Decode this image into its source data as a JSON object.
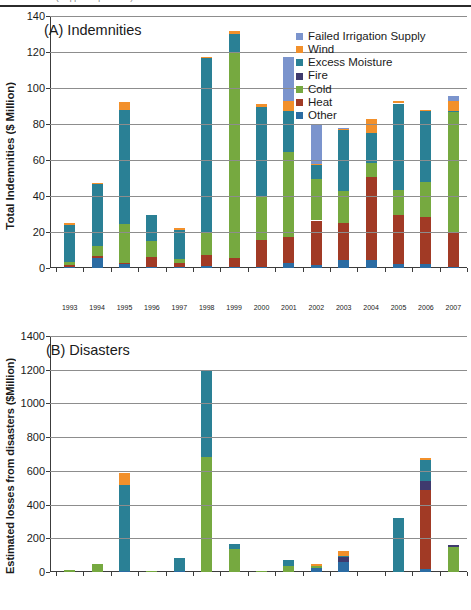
{
  "figure": {
    "top_rule_ghost_text": "(cropped caption line)"
  },
  "chart_data": [
    {
      "id": "panel_a",
      "type": "bar",
      "stacked": true,
      "title": "(A) Indemnities",
      "xlabel": "",
      "ylabel": "Total Indemnities ($ Million)",
      "ylim": [
        0,
        140
      ],
      "yticks": [
        0,
        20,
        40,
        60,
        80,
        100,
        120,
        140
      ],
      "grid": true,
      "legend_position": "top-right",
      "categories": [
        "1993",
        "1994",
        "1995",
        "1996",
        "1997",
        "1998",
        "1999",
        "2000",
        "2001",
        "2002",
        "2003",
        "2004",
        "2005",
        "2006",
        "2007"
      ],
      "series": [
        {
          "name": "Other",
          "color": "#2b6ca3",
          "values": [
            0.6,
            5.3,
            2.0,
            0.5,
            0.5,
            1.2,
            0.5,
            0.8,
            3.0,
            1.8,
            4.2,
            4.6,
            2.2,
            2.0,
            0.4
          ]
        },
        {
          "name": "Heat",
          "color": "#a13a25",
          "values": [
            1.2,
            1.5,
            1.0,
            5.7,
            2.3,
            6.2,
            5.2,
            14.7,
            14.0,
            24.6,
            20.6,
            46.2,
            27.2,
            26.6,
            19.6
          ]
        },
        {
          "name": "Cold",
          "color": "#76a940",
          "values": [
            1.8,
            5.4,
            21.5,
            8.9,
            2.4,
            12.8,
            114.5,
            24.0,
            47.2,
            23.0,
            18.0,
            7.8,
            14.2,
            19.2,
            66.8
          ]
        },
        {
          "name": "Fire",
          "color": "#3f3a6e",
          "values": [
            0.0,
            0.0,
            0.0,
            0.0,
            0.0,
            0.0,
            0.0,
            0.0,
            0.0,
            0.0,
            0.0,
            0.0,
            0.0,
            0.0,
            0.0
          ]
        },
        {
          "name": "Excess Moisture",
          "color": "#2a8095",
          "values": [
            20.4,
            34.8,
            63.5,
            14.4,
            15.8,
            96.8,
            9.8,
            49.8,
            22.8,
            7.8,
            33.8,
            16.4,
            47.8,
            39.4,
            0.6
          ]
        },
        {
          "name": "Wind",
          "color": "#f2902b",
          "values": [
            0.8,
            0.4,
            4.2,
            0.0,
            1.2,
            0.4,
            1.8,
            1.8,
            5.8,
            0.8,
            0.8,
            7.8,
            1.2,
            0.2,
            5.2
          ]
        },
        {
          "name": "Failed Irrigation Supply",
          "color": "#7b94cd",
          "values": [
            0.0,
            0.0,
            0.0,
            0.0,
            0.0,
            0.0,
            0.0,
            0.0,
            24.6,
            21.2,
            0.6,
            0.0,
            0.0,
            0.0,
            3.2
          ]
        }
      ],
      "totals": [
        24.8,
        47.4,
        92.2,
        29.5,
        22.2,
        117.4,
        131.8,
        91.1,
        117.4,
        79.2,
        78.0,
        82.8,
        92.6,
        87.4,
        95.8
      ]
    },
    {
      "id": "panel_b",
      "type": "bar",
      "stacked": true,
      "title": "(B) Disasters",
      "xlabel": "",
      "ylabel": "Estimated losses from disasters ($Million)",
      "ylim": [
        0,
        1400
      ],
      "yticks": [
        0,
        200,
        400,
        600,
        800,
        1000,
        1200,
        1400
      ],
      "grid": true,
      "legend_position": "top-right",
      "categories": [
        "1993",
        "1994",
        "1995",
        "1996",
        "1997",
        "1998",
        "1999",
        "2000",
        "2001",
        "2002",
        "2003",
        "2004",
        "2005",
        "2006",
        "2007"
      ],
      "series": [
        {
          "name": "Other",
          "color": "#2b6ca3",
          "values": [
            0,
            0,
            6,
            0,
            8,
            0,
            0,
            0,
            0,
            22,
            62,
            0,
            0,
            16,
            0
          ]
        },
        {
          "name": "Heat",
          "color": "#a13a25",
          "values": [
            0,
            0,
            0,
            0,
            0,
            0,
            0,
            0,
            0,
            0,
            0,
            0,
            0,
            468,
            0
          ]
        },
        {
          "name": "Cold",
          "color": "#76a940",
          "values": [
            10,
            46,
            0,
            6,
            0,
            680,
            134,
            8,
            34,
            16,
            0,
            0,
            0,
            0,
            150
          ]
        },
        {
          "name": "Fire",
          "color": "#3f3a6e",
          "values": [
            0,
            0,
            0,
            0,
            0,
            0,
            0,
            0,
            0,
            0,
            26,
            0,
            0,
            58,
            12
          ]
        },
        {
          "name": "Excess moisture",
          "color": "#2a8095",
          "values": [
            0,
            0,
            508,
            0,
            76,
            512,
            32,
            0,
            40,
            0,
            8,
            0,
            318,
            120,
            0
          ]
        },
        {
          "name": "Wind",
          "color": "#f2902b",
          "values": [
            0,
            0,
            74,
            0,
            0,
            0,
            0,
            0,
            0,
            8,
            28,
            0,
            0,
            16,
            0
          ]
        }
      ],
      "totals": [
        10,
        46,
        588,
        6,
        84,
        1192,
        166,
        8,
        74,
        46,
        124,
        0,
        318,
        678,
        162
      ]
    }
  ],
  "panel_a": {
    "title": "(A) Indemnities",
    "ylabel": "Total Indemnities ($ Million)",
    "yticks": [
      "0",
      "20",
      "40",
      "60",
      "80",
      "100",
      "120",
      "140"
    ],
    "xlabels": [
      "1993",
      "1994",
      "1995",
      "1996",
      "1997",
      "1998",
      "1999",
      "2000",
      "2001",
      "2002",
      "2003",
      "2004",
      "2005",
      "2006",
      "2007"
    ],
    "legend": [
      {
        "label": "Failed Irrigation Supply",
        "color": "#7b94cd"
      },
      {
        "label": "Wind",
        "color": "#f2902b"
      },
      {
        "label": "Excess Moisture",
        "color": "#2a8095"
      },
      {
        "label": "Fire",
        "color": "#3f3a6e"
      },
      {
        "label": "Cold",
        "color": "#76a940"
      },
      {
        "label": "Heat",
        "color": "#a13a25"
      },
      {
        "label": "Other",
        "color": "#2b6ca3"
      }
    ]
  },
  "panel_b": {
    "title": "(B) Disasters",
    "ylabel": "Estimated losses from disasters ($Million)",
    "yticks": [
      "0",
      "200",
      "400",
      "600",
      "800",
      "1000",
      "1200",
      "1400"
    ],
    "xlabels": [
      "1993",
      "1994",
      "1995",
      "1996",
      "1997",
      "1998",
      "1999",
      "2000",
      "2001",
      "2002",
      "2003",
      "2004",
      "2005",
      "2006",
      "2007"
    ],
    "legend": [
      {
        "label": "Wind",
        "color": "#f2902b"
      },
      {
        "label": "Excess moisture",
        "color": "#2a8095"
      },
      {
        "label": "Fire",
        "color": "#3f3a6e"
      },
      {
        "label": "Cold",
        "color": "#76a940"
      },
      {
        "label": "Heat",
        "color": "#a13a25"
      },
      {
        "label": "Other",
        "color": "#2b6ca3"
      }
    ]
  }
}
